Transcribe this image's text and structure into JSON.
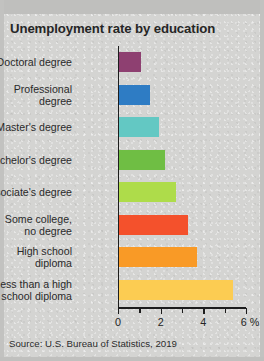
{
  "title": "Unemployment rate by education",
  "source": "Source: U.S. Bureau of Statistics, 2019",
  "axis": {
    "tick_labels": [
      "0",
      "2",
      "4",
      "6 %"
    ],
    "tick_values": [
      0,
      2,
      4,
      6
    ],
    "minor_values": [
      1,
      3,
      5
    ]
  },
  "chart_data": {
    "type": "bar",
    "orientation": "horizontal",
    "title": "Unemployment rate by education",
    "xlabel": "%",
    "ylabel": "",
    "xlim": [
      0,
      6
    ],
    "grid": false,
    "legend": "none",
    "source": "Source: U.S. Bureau of Statistics, 2019",
    "categories": [
      "Doctoral degree",
      "Professional\ndegree",
      "Master's degree",
      "Bachelor's degree",
      "Associate's degree",
      "Some college,\nno degree",
      "High school\ndiploma",
      "Less than a high\nschool diploma"
    ],
    "values": [
      1.1,
      1.5,
      1.9,
      2.2,
      2.7,
      3.3,
      3.7,
      5.4
    ],
    "colors": [
      "#8E4071",
      "#2E7CC4",
      "#63C8C3",
      "#6FBE44",
      "#AEDC4A",
      "#F4512C",
      "#F99A26",
      "#FCCC52"
    ]
  }
}
